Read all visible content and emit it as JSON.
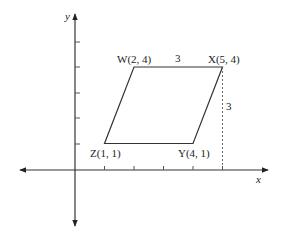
{
  "diagram": {
    "type": "coordinate-plane-parallelogram",
    "axes": {
      "x_label": "x",
      "y_label": "y"
    },
    "points": [
      {
        "name": "W",
        "label": "W(2, 4)",
        "x": 2,
        "y": 4
      },
      {
        "name": "X",
        "label": "X(5, 4)",
        "x": 5,
        "y": 4
      },
      {
        "name": "Y",
        "label": "Y(4, 1)",
        "x": 4,
        "y": 1
      },
      {
        "name": "Z",
        "label": "Z(1, 1)",
        "x": 1,
        "y": 1
      }
    ],
    "measurements": {
      "top_side_length": "3",
      "height": "3"
    },
    "x_ticks": [
      1,
      2,
      3,
      4,
      5
    ],
    "y_ticks": [
      1,
      2,
      3,
      4,
      5
    ]
  }
}
